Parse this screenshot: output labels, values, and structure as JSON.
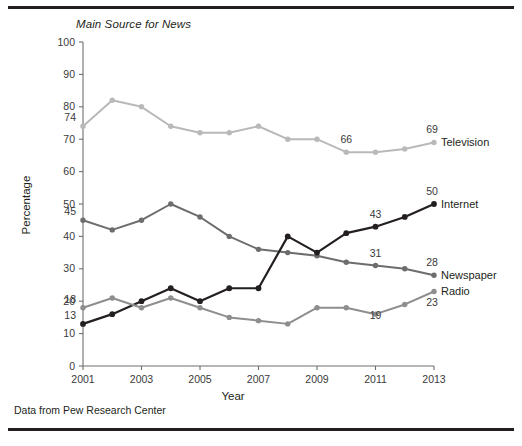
{
  "figure": {
    "title": "Main Source for News",
    "caption": "Data from Pew Research Center"
  },
  "chart_data": {
    "type": "line",
    "title": "Main Source for News",
    "xlabel": "Year",
    "ylabel": "Percentage",
    "xlim": [
      2001,
      2013
    ],
    "ylim": [
      0,
      100
    ],
    "xticks": [
      2001,
      2003,
      2005,
      2007,
      2009,
      2011,
      2013
    ],
    "xtick_labels": [
      "2001",
      "2003",
      "2005",
      "2007",
      "2009",
      "2011",
      "2013"
    ],
    "yticks": [
      0,
      10,
      20,
      30,
      40,
      50,
      60,
      70,
      80,
      90,
      100
    ],
    "ytick_labels": [
      "0",
      "10",
      "20",
      "30",
      "40",
      "50",
      "60",
      "70",
      "80",
      "90",
      "100"
    ],
    "grid": false,
    "legend_position": "right-of-line-ends",
    "x": [
      2001,
      2002,
      2003,
      2004,
      2005,
      2006,
      2007,
      2008,
      2009,
      2010,
      2011,
      2012,
      2013
    ],
    "series": [
      {
        "name": "Television",
        "color": "#b9b9b9",
        "values": [
          74,
          82,
          80,
          74,
          72,
          72,
          74,
          70,
          70,
          66,
          66,
          67,
          69
        ],
        "end_label": "Television",
        "annotations": [
          {
            "x": 2001,
            "value": 74,
            "text": "74"
          },
          {
            "x": 2010,
            "value": 66,
            "text": "66"
          },
          {
            "x": 2013,
            "value": 69,
            "text": "69"
          }
        ]
      },
      {
        "name": "Newspaper",
        "color": "#6d6d6d",
        "values": [
          45,
          42,
          45,
          50,
          46,
          40,
          36,
          35,
          34,
          32,
          31,
          30,
          28
        ],
        "end_label": "Newspaper",
        "annotations": [
          {
            "x": 2001,
            "value": 45,
            "text": "45"
          },
          {
            "x": 2011,
            "value": 31,
            "text": "31"
          },
          {
            "x": 2013,
            "value": 28,
            "text": "28"
          }
        ]
      },
      {
        "name": "Internet",
        "color": "#231f20",
        "values": [
          13,
          16,
          20,
          24,
          20,
          24,
          24,
          40,
          35,
          41,
          43,
          46,
          50
        ],
        "end_label": "Internet",
        "annotations": [
          {
            "x": 2001,
            "value": 13,
            "text": "13"
          },
          {
            "x": 2011,
            "value": 43,
            "text": "43"
          },
          {
            "x": 2013,
            "value": 50,
            "text": "50"
          }
        ]
      },
      {
        "name": "Radio",
        "color": "#8e8e8e",
        "values": [
          18,
          21,
          18,
          21,
          18,
          15,
          14,
          13,
          18,
          18,
          16,
          19,
          23
        ],
        "end_label": "Radio",
        "annotations": [
          {
            "x": 2001,
            "value": 18,
            "text": "18"
          },
          {
            "x": 2011,
            "value": 19,
            "text": "19"
          },
          {
            "x": 2013,
            "value": 23,
            "text": "23"
          }
        ]
      }
    ]
  }
}
